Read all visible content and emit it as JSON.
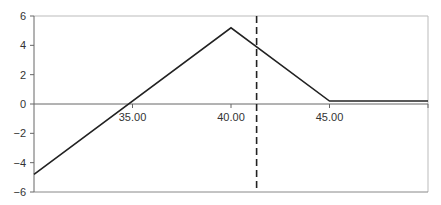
{
  "chart_data": {
    "type": "line",
    "title": "",
    "xlabel": "",
    "ylabel": "",
    "xlim": [
      30,
      50
    ],
    "ylim": [
      -6,
      6
    ],
    "grid": false,
    "legend": null,
    "x_ticks": [
      35,
      40,
      45
    ],
    "x_tick_labels": [
      "35.00",
      "40.00",
      "45.00"
    ],
    "y_ticks": [
      -6,
      -4,
      -2,
      0,
      2,
      4,
      6
    ],
    "y_tick_labels": [
      "-6",
      "-4",
      "-2",
      "0",
      "2",
      "4",
      "6"
    ],
    "series": [
      {
        "name": "payoff",
        "style": "solid",
        "color": "#222222",
        "points": [
          [
            30,
            -4.8
          ],
          [
            40,
            5.2
          ],
          [
            45,
            0.2
          ],
          [
            50,
            0.2
          ]
        ]
      }
    ],
    "annotations": [
      {
        "type": "vertical-dashed-line",
        "x": 41.3,
        "color": "#222222"
      }
    ]
  }
}
